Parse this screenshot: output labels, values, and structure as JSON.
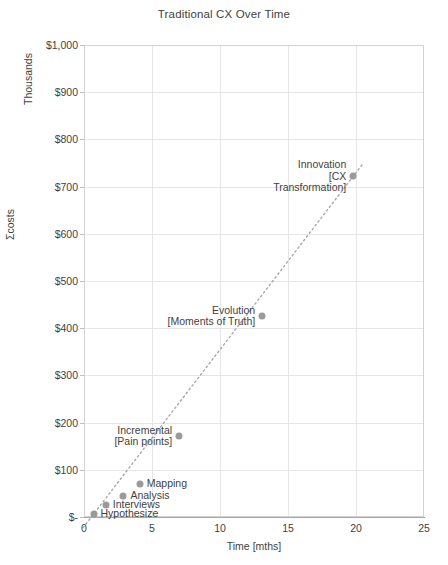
{
  "chart_data": {
    "type": "scatter",
    "title": "Traditional CX Over Time",
    "xlabel": "Time [mths]",
    "ylabel": "Σcosts",
    "y_unit_label": "Thousands",
    "xlim": [
      0,
      25
    ],
    "ylim": [
      0,
      1000
    ],
    "grid": true,
    "legend": "none",
    "xticks": [
      "0",
      "5",
      "10",
      "15",
      "20",
      "25"
    ],
    "xtick_values": [
      0,
      5,
      10,
      15,
      20,
      25
    ],
    "yticks": [
      "$-",
      "$100",
      "$200",
      "$300",
      "$400",
      "$500",
      "$600",
      "$700",
      "$800",
      "$900",
      "$1,000"
    ],
    "ytick_values": [
      0,
      100,
      200,
      300,
      400,
      500,
      600,
      700,
      800,
      900,
      1000
    ],
    "series": [
      {
        "name": "Traditional CX cumulative cost",
        "marker_color": "#9a9a9a",
        "trendline": "dotted",
        "trendline_color": "#a8a8a8",
        "points": [
          {
            "label": "Hypothesize",
            "x": 0.7,
            "y": 6,
            "label_pos": "left"
          },
          {
            "label": "Interviews",
            "x": 1.6,
            "y": 25,
            "label_pos": "left"
          },
          {
            "label": "Analysis",
            "x": 2.9,
            "y": 44,
            "label_pos": "left"
          },
          {
            "label": "Mapping",
            "x": 4.1,
            "y": 70,
            "label_pos": "left"
          },
          {
            "label": "Incremental\n[Pain points]",
            "x": 7.0,
            "y": 172,
            "label_pos": "right"
          },
          {
            "label": "Evolution\n[Moments of Truth]",
            "x": 13.1,
            "y": 426,
            "label_pos": "right"
          },
          {
            "label": "Innovation\n[CX\nTransformation]",
            "x": 19.8,
            "y": 722,
            "label_pos": "right"
          }
        ]
      }
    ]
  },
  "colors": {
    "marker": "#9a9a9a",
    "trendline": "#a8a8a8",
    "grid": "#e6e6e6",
    "axis": "#a6a6a6",
    "text": "#3f3f3f",
    "background": "#ffffff"
  }
}
